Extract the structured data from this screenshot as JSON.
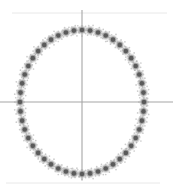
{
  "figure": {
    "width": 173,
    "height": 190,
    "background_color": "#ffffff",
    "title": ""
  },
  "style": {
    "marker_core_color": "#5a5a5a",
    "marker_mid_color": "#8d8d8d",
    "marker_halo_color": "#b8b8b8",
    "axis_color": "#a6a6a6",
    "ellipse_curve_color": "#c2c2c2",
    "rule_color": "#e8e8e8"
  },
  "axes": {
    "center_x": 82,
    "center_y": 102,
    "horizontal_axis": {
      "y": 102,
      "x_start": 0,
      "x_end": 173
    },
    "vertical_axis": {
      "x": 82,
      "y_start": 10,
      "y_end": 180
    }
  },
  "rules": [
    {
      "name": "top-rule",
      "y": 13,
      "x_start": 12,
      "x_end": 167
    },
    {
      "name": "bottom-rule",
      "y": 183,
      "x_start": 6,
      "x_end": 160
    }
  ],
  "chart_data": {
    "type": "scatter",
    "title": "",
    "xlabel": "",
    "ylabel": "",
    "grid": false,
    "legend": null,
    "xlim": [
      -1.2,
      1.2
    ],
    "ylim": [
      -1.2,
      1.2
    ],
    "n_points": 48,
    "shape": "ellipse",
    "ellipse": {
      "center": [
        0,
        0
      ],
      "semi_axis_x": 1.0,
      "semi_axis_y": 1.0,
      "pixel_center": [
        82,
        102
      ],
      "pixel_radius_x": 62,
      "pixel_radius_y": 72
    },
    "series": [
      {
        "name": "ring-points",
        "marker": "filled-circle",
        "angles_deg": [
          0,
          7.5,
          15,
          22.5,
          30,
          37.5,
          45,
          52.5,
          60,
          67.5,
          75,
          82.5,
          90,
          97.5,
          105,
          112.5,
          120,
          127.5,
          135,
          142.5,
          150,
          157.5,
          165,
          172.5,
          180,
          187.5,
          195,
          202.5,
          210,
          217.5,
          225,
          232.5,
          240,
          247.5,
          255,
          262.5,
          270,
          277.5,
          285,
          292.5,
          300,
          307.5,
          315,
          322.5,
          330,
          337.5,
          345,
          352.5
        ],
        "x": [
          1.0,
          0.991,
          0.966,
          0.924,
          0.866,
          0.793,
          0.707,
          0.609,
          0.5,
          0.383,
          0.259,
          0.131,
          0.0,
          -0.131,
          -0.259,
          -0.383,
          -0.5,
          -0.609,
          -0.707,
          -0.793,
          -0.866,
          -0.924,
          -0.966,
          -0.991,
          -1.0,
          -0.991,
          -0.966,
          -0.924,
          -0.866,
          -0.793,
          -0.707,
          -0.609,
          -0.5,
          -0.383,
          -0.259,
          -0.131,
          0.0,
          0.131,
          0.259,
          0.383,
          0.5,
          0.609,
          0.707,
          0.793,
          0.866,
          0.924,
          0.966,
          0.991
        ],
        "y": [
          0.0,
          0.131,
          0.259,
          0.383,
          0.5,
          0.609,
          0.707,
          0.793,
          0.866,
          0.924,
          0.966,
          0.991,
          1.0,
          0.991,
          0.966,
          0.924,
          0.866,
          0.793,
          0.707,
          0.609,
          0.5,
          0.383,
          0.259,
          0.131,
          0.0,
          -0.131,
          -0.259,
          -0.383,
          -0.5,
          -0.609,
          -0.707,
          -0.793,
          -0.866,
          -0.924,
          -0.966,
          -0.991,
          -1.0,
          -0.991,
          -0.966,
          -0.924,
          -0.866,
          -0.793,
          -0.707,
          -0.609,
          -0.5,
          -0.383,
          -0.259,
          -0.131
        ]
      }
    ]
  }
}
